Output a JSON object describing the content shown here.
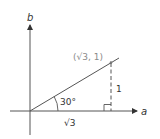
{
  "diagram": {
    "axis_x_label": "a",
    "axis_y_label": "b",
    "point_label": "(√3, 1)",
    "angle_label": "30°",
    "opposite_label": "1",
    "adjacent_label": "√3",
    "colors": {
      "lines": "#555555",
      "point_label": "#8a8a8a"
    }
  }
}
